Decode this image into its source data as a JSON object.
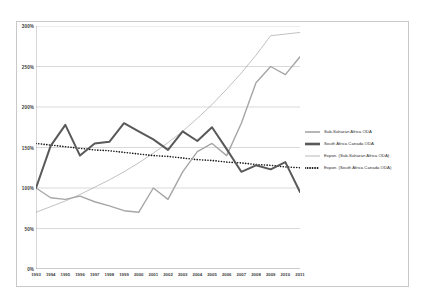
{
  "chart_data": {
    "type": "line",
    "title": "",
    "xlabel": "",
    "ylabel": "",
    "ylim": [
      0,
      300
    ],
    "ytick_labels": [
      "0%",
      "50%",
      "100%",
      "150%",
      "200%",
      "250%",
      "300%"
    ],
    "ytick_values": [
      0,
      50,
      100,
      150,
      200,
      250,
      300
    ],
    "grid": true,
    "legend_position": "right",
    "categories": [
      "1993",
      "1994",
      "1995",
      "1996",
      "1997",
      "1998",
      "1999",
      "2000",
      "2001",
      "2002",
      "2003",
      "2004",
      "2005",
      "2006",
      "2007",
      "2008",
      "2009",
      "2010",
      "2011"
    ],
    "series": [
      {
        "name": "Sub-Saharan Africa ODA",
        "color": "#a6a6a6",
        "style": "solid",
        "width": 1.4,
        "values": [
          100,
          88,
          86,
          90,
          83,
          78,
          72,
          70,
          100,
          86,
          120,
          145,
          155,
          140,
          180,
          230,
          250,
          240,
          262
        ]
      },
      {
        "name": "South Africa Canada ODA",
        "color": "#595959",
        "style": "solid",
        "width": 2.0,
        "values": [
          100,
          152,
          178,
          140,
          155,
          157,
          180,
          170,
          160,
          147,
          170,
          158,
          175,
          148,
          120,
          128,
          123,
          132,
          95
        ]
      },
      {
        "name": "Expon. (Sub-Saharan Africa ODA)",
        "color": "#a6a6a6",
        "style": "solid",
        "width": 0.7,
        "trendline": true,
        "values": [
          70,
          77,
          84,
          92,
          101,
          110,
          120,
          131,
          143,
          156,
          170,
          186,
          203,
          222,
          242,
          264,
          288,
          290,
          292
        ]
      },
      {
        "name": "Expon. (South Africa Canada ODA)",
        "color": "#1a1a1a",
        "style": "dotted",
        "width": 1.6,
        "trendline": true,
        "values": [
          155,
          153,
          151,
          149,
          147,
          146,
          144,
          142,
          140,
          139,
          137,
          135,
          134,
          132,
          131,
          129,
          128,
          126,
          125
        ]
      }
    ]
  },
  "legend": {
    "items": [
      {
        "label": "Sub-Saharan Africa ODA",
        "color": "#a6a6a6",
        "style": "solid",
        "width": 1.6
      },
      {
        "label": "South Africa Canada ODA",
        "color": "#595959",
        "style": "solid",
        "width": 2.6
      },
      {
        "label": "Expon. (Sub-Saharan Africa ODA)",
        "color": "#a6a6a6",
        "style": "solid",
        "width": 0.8
      },
      {
        "label": "Expon. (South Africa Canada ODA)",
        "color": "#1a1a1a",
        "style": "dotted",
        "width": 1.8
      }
    ]
  },
  "colors": {
    "grid": "#bfbfbf",
    "axis": "#9d9d9d",
    "frame": "#c9c9c9",
    "text": "#3b3b3b",
    "background": "#ffffff"
  }
}
